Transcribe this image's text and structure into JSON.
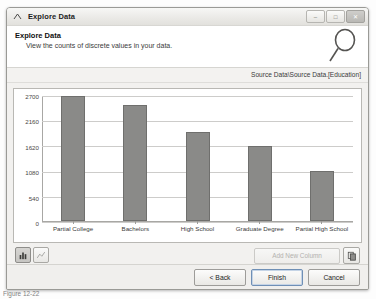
{
  "window": {
    "title": "Explore Data",
    "title_icon": "explore-chevron-icon",
    "buttons": {
      "minimize": "–",
      "maximize": "□",
      "close": "✕"
    }
  },
  "header": {
    "title": "Explore Data",
    "subtitle": "View the counts of discrete values in your data.",
    "icon": "magnifier-icon"
  },
  "source": {
    "path": "Source Data\\Source Data.[Education]"
  },
  "chart_data": {
    "type": "bar",
    "title": "",
    "xlabel": "",
    "ylabel": "",
    "categories": [
      "Partial College",
      "Bachelors",
      "High School",
      "Graduate Degree",
      "Partial High School"
    ],
    "values": [
      2690,
      2510,
      1925,
      1620,
      1080
    ],
    "yticks": [
      0,
      540,
      1080,
      1620,
      2160,
      2700
    ],
    "ytick_labels": [
      "0",
      "540",
      "1080",
      "1620",
      "2160",
      "2700"
    ],
    "ylim": [
      0,
      2700
    ],
    "grid": true,
    "legend": "none",
    "bar_color": "#8a8a88",
    "bar_border_color": "#6f6f6d",
    "plot_bg": "#ffffff"
  },
  "chart_toolbar": {
    "bar_view_icon": "bar-chart-icon",
    "line_view_icon": "line-chart-icon",
    "add_column_label": "Add New Column",
    "copy_icon": "copy-icon"
  },
  "footer": {
    "back_label": "< Back",
    "finish_label": "Finish",
    "cancel_label": "Cancel"
  },
  "caption": {
    "text": "Figure 12-22"
  }
}
